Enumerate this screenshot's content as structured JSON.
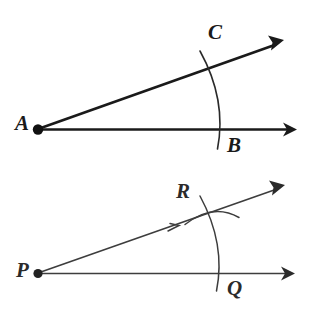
{
  "figure": {
    "type": "geometric-construction-diagram",
    "background_color": "#ffffff",
    "ink_color_primary": "#1a1a1a",
    "ink_color_secondary": "#3d3d3d"
  },
  "top_diagram": {
    "name": "original-angle-BAC",
    "vertex_label": "A",
    "ray_labels": [
      "B",
      "C"
    ],
    "arc_label": "",
    "vertex": {
      "x": 38,
      "y": 129
    },
    "ray_horizontal": {
      "x1": 38,
      "y1": 129,
      "x2": 296,
      "y2": 129,
      "arrow": true
    },
    "ray_upper": {
      "x1": 38,
      "y1": 129,
      "x2": 283,
      "y2": 41,
      "arrow": true
    },
    "arc": {
      "start_x": 200,
      "start_y": 51,
      "end_x": 218,
      "end_y": 149,
      "control_x": 228,
      "control_y": 100
    },
    "line_width": 2.6,
    "dot_radius": 5
  },
  "bottom_diagram": {
    "name": "copied-angle-QPR",
    "vertex_label": "P",
    "ray_labels": [
      "Q",
      "R"
    ],
    "vertex": {
      "x": 38,
      "y": 273
    },
    "ray_horizontal": {
      "x1": 38,
      "y1": 273,
      "x2": 294,
      "y2": 273,
      "arrow": true
    },
    "ray_upper": {
      "x1": 38,
      "y1": 273,
      "x2": 284,
      "y2": 186,
      "arrow": true
    },
    "arc_main": {
      "start_x": 200,
      "start_y": 196,
      "end_x": 216,
      "end_y": 291,
      "control_x": 226,
      "control_y": 244
    },
    "arc_cross": {
      "start_x": 185,
      "start_y": 224,
      "end_x": 239,
      "end_y": 217,
      "control_x": 213,
      "control_y": 203
    },
    "tick_mark": {
      "x": 176,
      "y": 227
    },
    "line_width": 1.5,
    "dot_radius": 4.5
  },
  "labels": {
    "A": "A",
    "B": "B",
    "C": "C",
    "P": "P",
    "Q": "Q",
    "R": "R"
  }
}
